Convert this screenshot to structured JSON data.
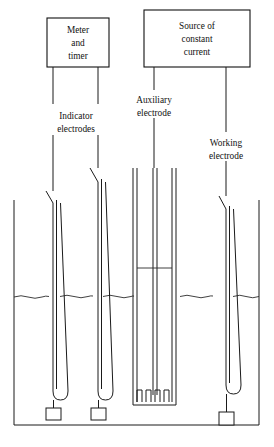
{
  "figure": {
    "background_color": "#ffffff",
    "line_color": "#1a1a1a",
    "width": 274,
    "height": 447
  },
  "boxes": [
    {
      "id": "meter-and-timer",
      "lines": [
        "Meter",
        "and",
        "timer"
      ],
      "line1": "Meter",
      "line2": "and",
      "line3": "timer"
    },
    {
      "id": "source-of-constant-current",
      "lines": [
        "Source of",
        "constant",
        "current"
      ],
      "line1": "Source of",
      "line2": "constant",
      "line3": "current"
    }
  ],
  "labels": {
    "indicator_electrodes": {
      "line1": "Indicator",
      "line2": "electrodes"
    },
    "auxiliary_electrode": {
      "line1": "Auxiliary",
      "line2": "electrode"
    },
    "working_electrode": {
      "line1": "Working",
      "line2": "electrode"
    }
  },
  "components": {
    "beaker": "beaker-vessel",
    "solution_level": "wavy-liquid-level-line",
    "electrodes": [
      "indicator-electrode-left",
      "indicator-electrode-right",
      "auxiliary-electrode",
      "working-electrode"
    ],
    "auxiliary_detail": "porous-frit-comb-tip",
    "electrode_tips": "square-metal-tips"
  }
}
